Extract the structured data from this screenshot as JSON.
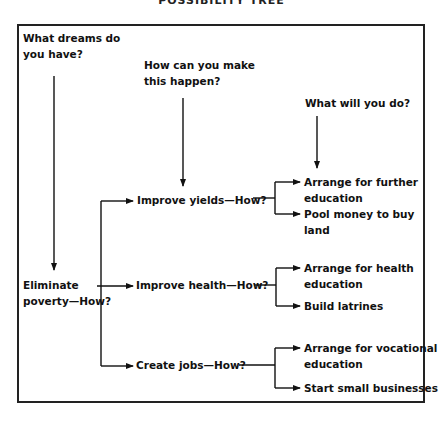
{
  "title": "POSSIBILITY TREE",
  "questions": {
    "dreams": [
      "What dreams do",
      "you have?"
    ],
    "how_happen": [
      "How can you make",
      "this happen?"
    ],
    "what_do": [
      "What will you do?"
    ]
  },
  "root": {
    "lines": [
      "Eliminate",
      "poverty—How?"
    ]
  },
  "branches": [
    {
      "label": "Improve yields—How?",
      "actions": [
        [
          "Arrange for further",
          "education"
        ],
        [
          "Pool money to buy",
          "land"
        ]
      ]
    },
    {
      "label": "Improve health—How?",
      "actions": [
        [
          "Arrange for health",
          "education"
        ],
        [
          "Build latrines"
        ]
      ]
    },
    {
      "label": "Create jobs—How?",
      "actions": [
        [
          "Arrange for vocational",
          "education"
        ],
        [
          "Start small businesses"
        ]
      ]
    }
  ]
}
